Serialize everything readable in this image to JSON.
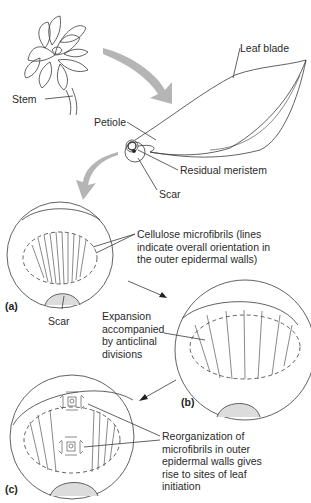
{
  "figure": {
    "labels": {
      "stem": "Stem",
      "leaf_blade": "Leaf blade",
      "petiole": "Petiole",
      "residual_meristem": "Residual meristem",
      "scar_top": "Scar",
      "scar_a": "Scar",
      "microfibrils": [
        "Cellulose microfibrils (lines",
        "indicate overall orientation in",
        "the outer epidermal walls)"
      ],
      "expansion": [
        "Expansion",
        "accompanied",
        "by anticlinal",
        "divisions"
      ],
      "reorganization": [
        "Reorganization of",
        "microfibrils in outer",
        "epidermal walls gives",
        "rise to sites of leaf",
        "initiation"
      ]
    },
    "panels": [
      {
        "id": "a",
        "tag": "(a)"
      },
      {
        "id": "b",
        "tag": "(b)"
      },
      {
        "id": "c",
        "tag": "(c)"
      }
    ],
    "colors": {
      "line": "#3a3a3a",
      "arrow_fill": "#b5b5b5",
      "scar_fill": "#dcdcdc"
    }
  }
}
